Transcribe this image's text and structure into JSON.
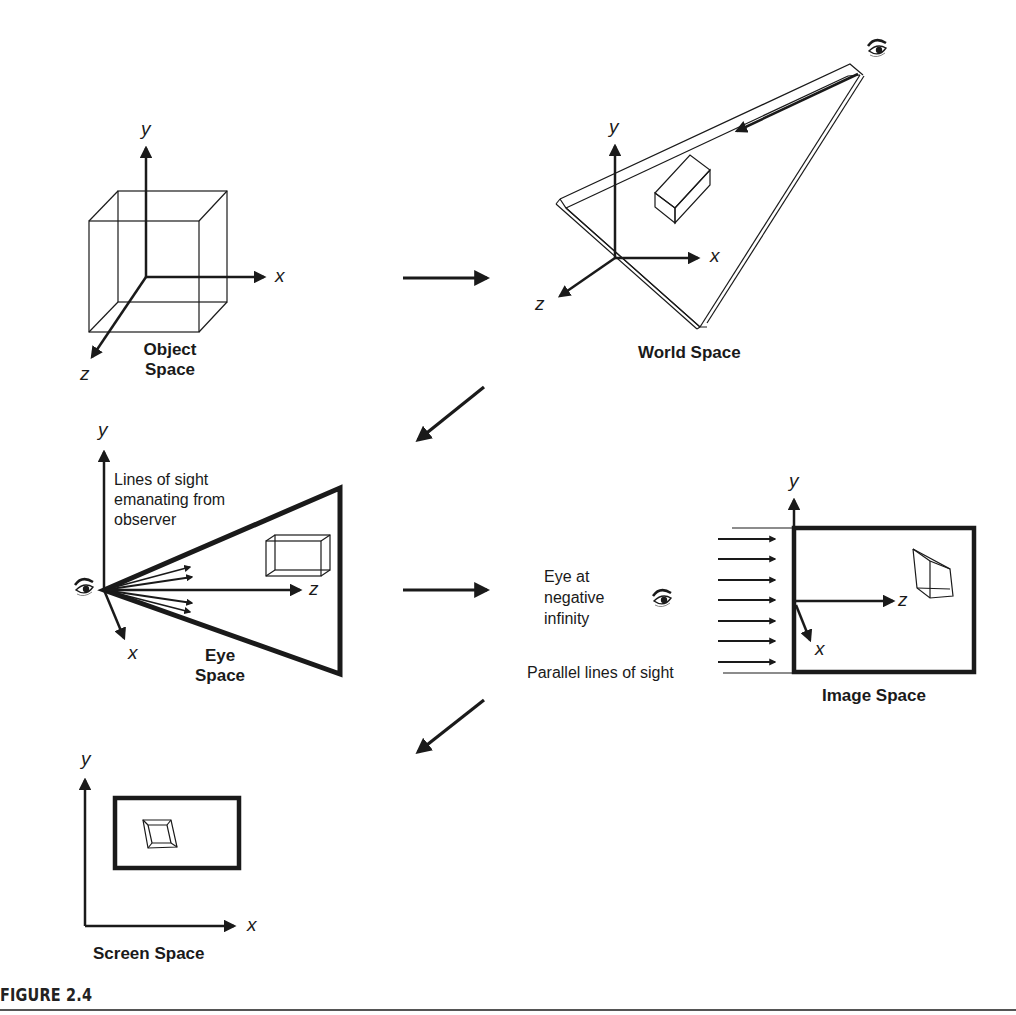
{
  "figure": {
    "caption": "FIGURE 2.4"
  },
  "panels": {
    "object_space": {
      "title_line1": "Object",
      "title_line2": "Space",
      "axes": {
        "x": "x",
        "y": "y",
        "z": "z"
      }
    },
    "world_space": {
      "title": "World Space",
      "axes": {
        "x": "x",
        "y": "y",
        "z": "z"
      }
    },
    "eye_space": {
      "title_line1": "Eye",
      "title_line2": "Space",
      "axes": {
        "x": "x",
        "y": "y",
        "z": "z"
      },
      "note_line1": "Lines of sight",
      "note_line2": "emanating from",
      "note_line3": "observer"
    },
    "image_space": {
      "title": "Image Space",
      "axes": {
        "x": "x",
        "y": "y",
        "z": "z"
      },
      "eye_note_line1": "Eye at",
      "eye_note_line2": "negative",
      "eye_note_line3": "infinity",
      "parallel_note": "Parallel lines of sight"
    },
    "screen_space": {
      "title": "Screen Space",
      "axes": {
        "x": "x",
        "y": "y"
      }
    }
  },
  "flow_arrows": [
    {
      "from": "Object Space",
      "to": "World Space",
      "direction": "right"
    },
    {
      "from": "World Space",
      "to": "Eye Space",
      "direction": "down-left"
    },
    {
      "from": "Eye Space",
      "to": "Image Space",
      "direction": "right"
    },
    {
      "from": "Image Space",
      "to": "Screen Space",
      "direction": "down-left"
    }
  ],
  "icons": [
    "eye-icon"
  ]
}
